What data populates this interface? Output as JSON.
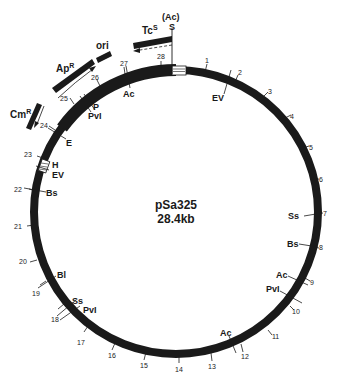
{
  "diagram": {
    "type": "plasmid-map",
    "name": "pSa325",
    "size": "28.4kb",
    "total_kb": 28.4,
    "colors": {
      "ring": "#1a1a1a",
      "text": "#1a1a1a",
      "background": "#ffffff"
    },
    "kb_ticks": [
      "1",
      "2",
      "3",
      "4",
      "5",
      "6",
      "7",
      "8",
      "9",
      "10",
      "11",
      "12",
      "13",
      "14",
      "15",
      "16",
      "17",
      "18",
      "19",
      "20",
      "21",
      "22",
      "23",
      "24",
      "25",
      "26",
      "27",
      "28"
    ],
    "restriction_sites": [
      {
        "label": "S",
        "kb": 0.0,
        "note": "(Ac)"
      },
      {
        "label": "EV",
        "kb": 1.7
      },
      {
        "label": "Ss",
        "kb": 7.05
      },
      {
        "label": "Bs",
        "kb": 7.95
      },
      {
        "label": "Ac",
        "kb": 9.1
      },
      {
        "label": "PvI",
        "kb": 9.6
      },
      {
        "label": "Ac",
        "kb": 12.0
      },
      {
        "label": "PvI",
        "kb": 18.0
      },
      {
        "label": "Ss",
        "kb": 18.2
      },
      {
        "label": "Bl",
        "kb": 19.3
      },
      {
        "label": "Bs",
        "kb": 22.1
      },
      {
        "label": "EV",
        "kb": 22.9
      },
      {
        "label": "H",
        "kb": 23.2
      },
      {
        "label": "E",
        "kb": 24.1
      },
      {
        "label": "PvI",
        "kb": 25.4
      },
      {
        "label": "P",
        "kb": 25.6
      },
      {
        "label": "Ac",
        "kb": 27.0
      }
    ],
    "genes": [
      {
        "label": "Tc",
        "superscript": "S",
        "direction": "counterclockwise",
        "dashed_arrow": true
      },
      {
        "label": "ori",
        "superscript": ""
      },
      {
        "label": "Ap",
        "superscript": "R",
        "direction": "clockwise"
      },
      {
        "label": "Cm",
        "superscript": "R",
        "direction": "counterclockwise"
      }
    ],
    "top_annotation": "(Ac)"
  }
}
